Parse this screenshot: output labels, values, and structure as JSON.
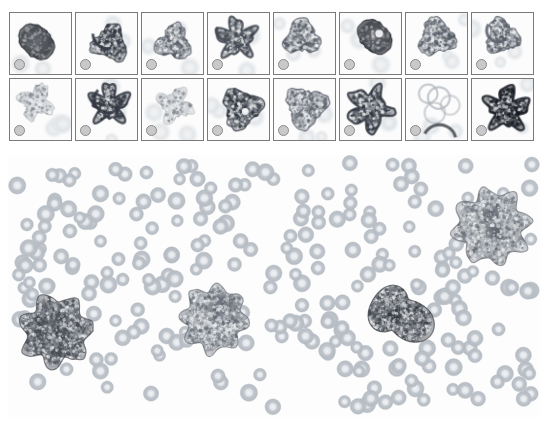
{
  "figure": {
    "background_color": "#ffffff",
    "width_px": 548,
    "height_px": 430
  },
  "thumbnail_grid": {
    "rows": 2,
    "columns": 8,
    "panel_width_px": 63,
    "panel_height_px": 63,
    "panel_gap_px": 3,
    "border_color": "#7a7a7a",
    "scale_marker": {
      "name": "scale-reference-circle",
      "shape": "circle",
      "diameter_px": 11,
      "fill_color": "#c9c9c9",
      "stroke_color": "#8a8a8a",
      "position": "bottom-left"
    },
    "panels": [
      {
        "index": 1,
        "row": 1,
        "col": 1,
        "label": "",
        "morphology": "dense round dark-stained cell with short tail",
        "stain_density": "very-dark",
        "texture": "solid",
        "seed": 101
      },
      {
        "index": 2,
        "row": 1,
        "col": 2,
        "label": "",
        "morphology": "granular cell with notched right border",
        "stain_density": "dark",
        "texture": "granular",
        "seed": 102
      },
      {
        "index": 3,
        "row": 1,
        "col": 3,
        "label": "",
        "morphology": "irregular granular cell, pale cytoplasm",
        "stain_density": "medium",
        "texture": "granular",
        "seed": 103
      },
      {
        "index": 4,
        "row": 1,
        "col": 4,
        "label": "",
        "morphology": "spiculated cell with dark scalloped edge",
        "stain_density": "medium-dark",
        "texture": "spiculated",
        "seed": 104
      },
      {
        "index": 5,
        "row": 1,
        "col": 5,
        "label": "",
        "morphology": "elongated diagonal granular cell",
        "stain_density": "medium",
        "texture": "granular",
        "seed": 105
      },
      {
        "index": 6,
        "row": 1,
        "col": 6,
        "label": "",
        "morphology": "dense dark cell with pale central vacuole",
        "stain_density": "very-dark",
        "texture": "solid",
        "seed": 106
      },
      {
        "index": 7,
        "row": 1,
        "col": 7,
        "label": "",
        "morphology": "granular cell adjacent to pale ring cell",
        "stain_density": "medium",
        "texture": "granular",
        "seed": 107
      },
      {
        "index": 8,
        "row": 1,
        "col": 8,
        "label": "",
        "morphology": "granular cell with dark crescent at upper left",
        "stain_density": "medium",
        "texture": "granular",
        "seed": 108
      },
      {
        "index": 9,
        "row": 2,
        "col": 1,
        "label": "",
        "morphology": "faint diffuse cell remnant, pale background",
        "stain_density": "light",
        "texture": "diffuse",
        "seed": 109
      },
      {
        "index": 10,
        "row": 2,
        "col": 2,
        "label": "",
        "morphology": "cell with pronounced dark scalloped membrane",
        "stain_density": "dark",
        "texture": "spiculated",
        "seed": 110
      },
      {
        "index": 11,
        "row": 2,
        "col": 3,
        "label": "",
        "morphology": "pale wispy cell, low contrast",
        "stain_density": "light",
        "texture": "diffuse",
        "seed": 111
      },
      {
        "index": 12,
        "row": 2,
        "col": 4,
        "label": "",
        "morphology": "heavily granular dark cell with pale vacuole",
        "stain_density": "dark",
        "texture": "granular",
        "seed": 112
      },
      {
        "index": 13,
        "row": 2,
        "col": 5,
        "label": "",
        "morphology": "clustered granules, fragmented outline",
        "stain_density": "medium",
        "texture": "granular",
        "seed": 113
      },
      {
        "index": 14,
        "row": 2,
        "col": 6,
        "label": "",
        "morphology": "stellate cell with long dark pseudopods",
        "stain_density": "dark",
        "texture": "spiculated",
        "seed": 114
      },
      {
        "index": 15,
        "row": 2,
        "col": 7,
        "label": "",
        "morphology": "pale ring structures, faint dark arc below",
        "stain_density": "light",
        "texture": "ring",
        "seed": 115
      },
      {
        "index": 16,
        "row": 2,
        "col": 8,
        "label": "",
        "morphology": "star-shaped very dark cell with spikes",
        "stain_density": "very-dark",
        "texture": "spiculated",
        "seed": 116
      }
    ]
  },
  "overview_image": {
    "name": "blood-smear-overview",
    "description": "Low-magnification peripheral blood smear field",
    "background_color": "#fdfdfd",
    "erythrocyte": {
      "label": "red blood cell",
      "count": 275,
      "fill_color": "#b9bfc6",
      "center_pallor_color": "#e9ecef",
      "mean_diameter_px": 15
    },
    "highlighted_cells": [
      {
        "id": 1,
        "label": "cell cluster",
        "cx": 56,
        "cy": 331,
        "r": 34,
        "tone": "dark-granular"
      },
      {
        "id": 2,
        "label": "large granular cell",
        "cx": 214,
        "cy": 319,
        "r": 32,
        "tone": "mid-granular"
      },
      {
        "id": 3,
        "label": "elongated spread cell",
        "cx": 400,
        "cy": 315,
        "r": 31,
        "tone": "dark-elongated"
      },
      {
        "id": 4,
        "label": "multilobed cell cluster",
        "cx": 492,
        "cy": 227,
        "r": 36,
        "tone": "mid-granular"
      }
    ]
  }
}
